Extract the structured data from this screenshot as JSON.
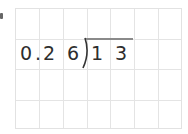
{
  "problem": {
    "divisor": [
      "0",
      ".",
      "2",
      "6"
    ],
    "dividend": [
      "1",
      "3"
    ],
    "expression_text": "0.26 ) 13"
  },
  "grid": {
    "columns": 7,
    "rows": 4,
    "line_color": "#e4e4e4"
  },
  "colors": {
    "digit": "#2e2e2e",
    "vinculum": "#8a8a8a"
  }
}
